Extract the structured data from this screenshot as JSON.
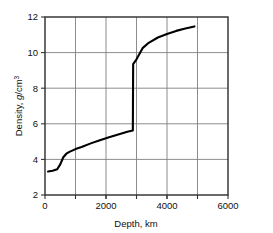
{
  "chart_data": {
    "type": "line",
    "title": "",
    "subtitle": "",
    "xlabel": "Depth, km",
    "ylabel": "Density, g/cm3",
    "ylabel_parts": {
      "prefix": "Density, ",
      "italic": "g",
      "middle": "/cm",
      "superscript": "3"
    },
    "xlim": [
      0,
      6000
    ],
    "ylim": [
      2,
      12
    ],
    "xticks": [
      0,
      2000,
      4000,
      6000
    ],
    "xtick_labels": [
      "0",
      "2000",
      "4000",
      "6000"
    ],
    "yticks": [
      2,
      4,
      6,
      8,
      10,
      12
    ],
    "ytick_labels": [
      "2",
      "4",
      "6",
      "8",
      "10",
      "12"
    ],
    "x_gridlines": [
      1000,
      2000,
      3000,
      4000,
      5000
    ],
    "y_gridlines": [
      4,
      6,
      8,
      10
    ],
    "grid": true,
    "legend": "none",
    "line_color": "#000000",
    "grid_color": "#808080",
    "axis_color": "#333333",
    "series": [
      {
        "name": "Earth density profile",
        "points": [
          [
            100,
            3.32
          ],
          [
            250,
            3.36
          ],
          [
            400,
            3.45
          ],
          [
            500,
            3.72
          ],
          [
            600,
            4.12
          ],
          [
            700,
            4.32
          ],
          [
            800,
            4.42
          ],
          [
            1000,
            4.58
          ],
          [
            1200,
            4.7
          ],
          [
            1500,
            4.9
          ],
          [
            1800,
            5.08
          ],
          [
            2100,
            5.24
          ],
          [
            2400,
            5.4
          ],
          [
            2700,
            5.55
          ],
          [
            2880,
            5.62
          ],
          [
            2890,
            9.35
          ],
          [
            3000,
            9.62
          ],
          [
            3200,
            10.25
          ],
          [
            3400,
            10.55
          ],
          [
            3700,
            10.85
          ],
          [
            4000,
            11.05
          ],
          [
            4300,
            11.22
          ],
          [
            4600,
            11.35
          ],
          [
            4900,
            11.47
          ]
        ]
      }
    ],
    "annotations": [
      {
        "label": "core-mantle density discontinuity",
        "x": 2890,
        "y_from": 5.62,
        "y_to": 9.35
      }
    ]
  }
}
